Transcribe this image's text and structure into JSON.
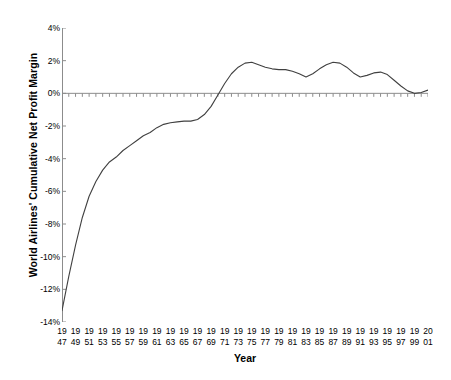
{
  "chart_data": {
    "type": "line",
    "title": "",
    "xlabel": "Year",
    "ylabel": "World Airlines' Cumulative Net Profit Margin",
    "xlim": [
      1947,
      2001
    ],
    "ylim": [
      -14,
      4
    ],
    "ytick_values": [
      4,
      2,
      0,
      -2,
      -4,
      -6,
      -8,
      -10,
      -12,
      -14
    ],
    "ytick_labels": [
      "4%",
      "2%",
      "0%",
      "-2%",
      "-4%",
      "-6%",
      "-8%",
      "-10%",
      "-12%",
      "-14%"
    ],
    "xtick_labels": [
      {
        "top": "19",
        "bottom": "47",
        "year": 1947
      },
      {
        "top": "19",
        "bottom": "49",
        "year": 1949
      },
      {
        "top": "19",
        "bottom": "51",
        "year": 1951
      },
      {
        "top": "19",
        "bottom": "53",
        "year": 1953
      },
      {
        "top": "19",
        "bottom": "55",
        "year": 1955
      },
      {
        "top": "19",
        "bottom": "57",
        "year": 1957
      },
      {
        "top": "19",
        "bottom": "59",
        "year": 1959
      },
      {
        "top": "19",
        "bottom": "61",
        "year": 1961
      },
      {
        "top": "19",
        "bottom": "63",
        "year": 1963
      },
      {
        "top": "19",
        "bottom": "65",
        "year": 1965
      },
      {
        "top": "19",
        "bottom": "67",
        "year": 1967
      },
      {
        "top": "19",
        "bottom": "69",
        "year": 1969
      },
      {
        "top": "19",
        "bottom": "71",
        "year": 1971
      },
      {
        "top": "19",
        "bottom": "73",
        "year": 1973
      },
      {
        "top": "19",
        "bottom": "75",
        "year": 1975
      },
      {
        "top": "19",
        "bottom": "77",
        "year": 1977
      },
      {
        "top": "19",
        "bottom": "79",
        "year": 1979
      },
      {
        "top": "19",
        "bottom": "81",
        "year": 1981
      },
      {
        "top": "19",
        "bottom": "83",
        "year": 1983
      },
      {
        "top": "19",
        "bottom": "85",
        "year": 1985
      },
      {
        "top": "19",
        "bottom": "87",
        "year": 1987
      },
      {
        "top": "19",
        "bottom": "89",
        "year": 1989
      },
      {
        "top": "19",
        "bottom": "91",
        "year": 1991
      },
      {
        "top": "19",
        "bottom": "93",
        "year": 1993
      },
      {
        "top": "19",
        "bottom": "95",
        "year": 1995
      },
      {
        "top": "19",
        "bottom": "97",
        "year": 1997
      },
      {
        "top": "19",
        "bottom": "99",
        "year": 1999
      },
      {
        "top": "20",
        "bottom": "01",
        "year": 2001
      }
    ],
    "grid": false,
    "legend": null,
    "line_color": "#404040",
    "axis_color": "#8c8c8c",
    "x": [
      1947,
      1948,
      1949,
      1950,
      1951,
      1952,
      1953,
      1954,
      1955,
      1956,
      1957,
      1958,
      1959,
      1960,
      1961,
      1962,
      1963,
      1964,
      1965,
      1966,
      1967,
      1968,
      1969,
      1970,
      1971,
      1972,
      1973,
      1974,
      1975,
      1976,
      1977,
      1978,
      1979,
      1980,
      1981,
      1982,
      1983,
      1984,
      1985,
      1986,
      1987,
      1988,
      1989,
      1990,
      1991,
      1992,
      1993,
      1994,
      1995,
      1996,
      1997,
      1998,
      1999,
      2000,
      2001
    ],
    "values": [
      -13.3,
      -11.2,
      -9.3,
      -7.6,
      -6.3,
      -5.4,
      -4.7,
      -4.2,
      -3.9,
      -3.5,
      -3.2,
      -2.9,
      -2.6,
      -2.4,
      -2.1,
      -1.9,
      -1.8,
      -1.75,
      -1.7,
      -1.7,
      -1.6,
      -1.3,
      -0.8,
      -0.1,
      0.6,
      1.2,
      1.6,
      1.85,
      1.9,
      1.75,
      1.6,
      1.5,
      1.45,
      1.45,
      1.35,
      1.2,
      1.0,
      1.2,
      1.5,
      1.75,
      1.9,
      1.85,
      1.6,
      1.25,
      1.0,
      1.1,
      1.25,
      1.3,
      1.15,
      0.8,
      0.45,
      0.15,
      0.0,
      0.05,
      0.2
    ],
    "series_note": "Cumulative net profit margin of world airlines, 1947-2001"
  },
  "axes": {
    "y_title": "World Airlines' Cumulative Net Profit Margin",
    "x_title": "Year"
  }
}
